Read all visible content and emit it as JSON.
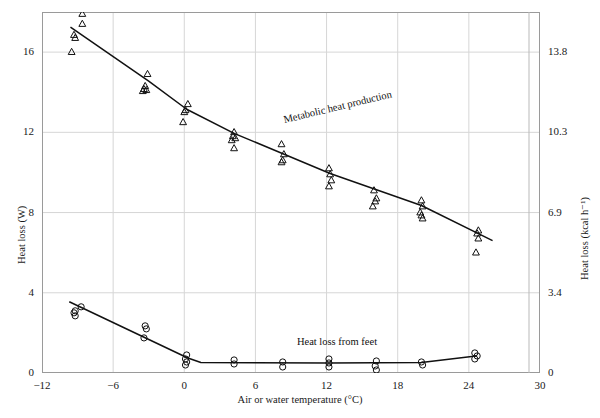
{
  "chart_data": {
    "type": "scatter",
    "title": "",
    "xlabel": "Air or water temperature (°C)",
    "ylabel": "Heat loss (W)",
    "ylabel_right": "Heat loss (kcal h⁻¹)",
    "xlim": [
      -12,
      30
    ],
    "ylim": [
      0,
      18
    ],
    "xticks": [
      -12,
      -6,
      0,
      6,
      12,
      18,
      24,
      30
    ],
    "xticklabels": [
      "−12",
      "−6",
      "0",
      "6",
      "12",
      "18",
      "24",
      "30"
    ],
    "yticks": [
      0,
      4,
      8,
      12,
      16
    ],
    "yticklabels": [
      "0",
      "4",
      "8",
      "12",
      "16"
    ],
    "yticks_right": [
      0,
      4,
      8,
      12,
      16
    ],
    "yticklabels_right": [
      "0",
      "3.4",
      "6.9",
      "10.3",
      "13.8"
    ],
    "grid": true,
    "legend": "none",
    "annotations": [
      {
        "text": "Metabolic heat production",
        "x": 8.5,
        "y": 12.9,
        "rotation": -13.5
      },
      {
        "text": "Heat loss from feet",
        "x": 9.5,
        "y": 1.85,
        "rotation": 0
      }
    ],
    "series": [
      {
        "name": "Metabolic heat production",
        "marker": "open-triangle",
        "line": "fitted",
        "line_points": [
          {
            "x": -9.6,
            "y": 17.25
          },
          {
            "x": -3.0,
            "y": 14.55
          },
          {
            "x": 0.2,
            "y": 13.15
          },
          {
            "x": 4.2,
            "y": 11.95
          },
          {
            "x": 12.3,
            "y": 9.95
          },
          {
            "x": 20.0,
            "y": 8.35
          },
          {
            "x": 26.0,
            "y": 6.6
          }
        ],
        "points": [
          {
            "x": -8.6,
            "y": 17.9
          },
          {
            "x": -8.6,
            "y": 17.4
          },
          {
            "x": -9.3,
            "y": 16.85
          },
          {
            "x": -9.2,
            "y": 16.7
          },
          {
            "x": -9.5,
            "y": 16.0
          },
          {
            "x": -3.1,
            "y": 14.9
          },
          {
            "x": -3.3,
            "y": 14.3
          },
          {
            "x": -3.4,
            "y": 14.15
          },
          {
            "x": -3.2,
            "y": 14.1
          },
          {
            "x": -3.5,
            "y": 14.05
          },
          {
            "x": 0.3,
            "y": 13.4
          },
          {
            "x": 0.1,
            "y": 13.1
          },
          {
            "x": 0.0,
            "y": 13.0
          },
          {
            "x": -0.1,
            "y": 12.5
          },
          {
            "x": 4.2,
            "y": 12.0
          },
          {
            "x": 4.1,
            "y": 11.8
          },
          {
            "x": 4.3,
            "y": 11.7
          },
          {
            "x": 4.0,
            "y": 11.6
          },
          {
            "x": 4.2,
            "y": 11.2
          },
          {
            "x": 8.2,
            "y": 11.4
          },
          {
            "x": 8.4,
            "y": 10.9
          },
          {
            "x": 8.3,
            "y": 10.6
          },
          {
            "x": 8.2,
            "y": 10.5
          },
          {
            "x": 12.2,
            "y": 10.2
          },
          {
            "x": 12.3,
            "y": 9.9
          },
          {
            "x": 12.4,
            "y": 9.6
          },
          {
            "x": 12.2,
            "y": 9.3
          },
          {
            "x": 16.0,
            "y": 9.1
          },
          {
            "x": 16.2,
            "y": 8.7
          },
          {
            "x": 16.1,
            "y": 8.55
          },
          {
            "x": 15.9,
            "y": 8.3
          },
          {
            "x": 20.0,
            "y": 8.6
          },
          {
            "x": 20.1,
            "y": 8.3
          },
          {
            "x": 19.9,
            "y": 8.0
          },
          {
            "x": 20.0,
            "y": 7.85
          },
          {
            "x": 20.1,
            "y": 7.7
          },
          {
            "x": 24.8,
            "y": 7.1
          },
          {
            "x": 24.7,
            "y": 6.95
          },
          {
            "x": 24.8,
            "y": 6.7
          },
          {
            "x": 24.6,
            "y": 6.0
          }
        ]
      },
      {
        "name": "Heat loss from feet",
        "marker": "open-circle",
        "line": "fitted",
        "line_points": [
          {
            "x": -9.7,
            "y": 3.55
          },
          {
            "x": 0.3,
            "y": 0.75
          },
          {
            "x": 1.4,
            "y": 0.52
          },
          {
            "x": 12.2,
            "y": 0.5
          },
          {
            "x": 20.0,
            "y": 0.52
          },
          {
            "x": 24.6,
            "y": 0.85
          }
        ],
        "points": [
          {
            "x": -8.7,
            "y": 3.3
          },
          {
            "x": -9.2,
            "y": 3.1
          },
          {
            "x": -9.3,
            "y": 3.0
          },
          {
            "x": -9.2,
            "y": 2.85
          },
          {
            "x": -3.3,
            "y": 2.35
          },
          {
            "x": -3.2,
            "y": 2.2
          },
          {
            "x": -3.4,
            "y": 1.75
          },
          {
            "x": 0.2,
            "y": 0.9
          },
          {
            "x": 0.1,
            "y": 0.7
          },
          {
            "x": 0.2,
            "y": 0.55
          },
          {
            "x": 0.1,
            "y": 0.4
          },
          {
            "x": 4.2,
            "y": 0.65
          },
          {
            "x": 4.2,
            "y": 0.45
          },
          {
            "x": 8.3,
            "y": 0.55
          },
          {
            "x": 8.3,
            "y": 0.3
          },
          {
            "x": 12.2,
            "y": 0.7
          },
          {
            "x": 12.2,
            "y": 0.5
          },
          {
            "x": 12.2,
            "y": 0.3
          },
          {
            "x": 16.2,
            "y": 0.6
          },
          {
            "x": 16.1,
            "y": 0.35
          },
          {
            "x": 16.2,
            "y": 0.15
          },
          {
            "x": 20.0,
            "y": 0.55
          },
          {
            "x": 20.1,
            "y": 0.4
          },
          {
            "x": 24.5,
            "y": 1.0
          },
          {
            "x": 24.7,
            "y": 0.85
          },
          {
            "x": 24.5,
            "y": 0.7
          }
        ]
      }
    ]
  }
}
